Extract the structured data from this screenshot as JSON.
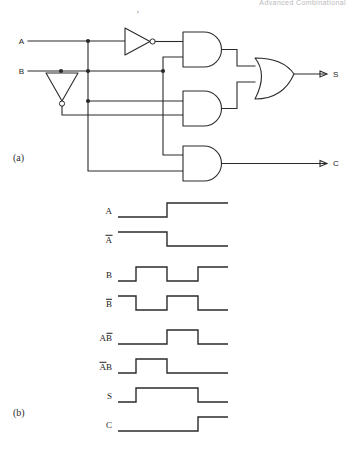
{
  "page": {
    "header_text": "Advanced Combinational",
    "figure_labels": {
      "a": "(a)",
      "b": "(b)"
    },
    "artifact_mark": "’"
  },
  "circuit": {
    "title_implied": "Half adder logic circuit",
    "inputs": [
      {
        "name": "A",
        "label": "A",
        "x": 22,
        "y": 41
      },
      {
        "name": "B",
        "label": "B",
        "x": 22,
        "y": 71
      }
    ],
    "outputs": [
      {
        "name": "S",
        "label": "S",
        "x": 335,
        "y": 73
      },
      {
        "name": "C",
        "label": "C",
        "x": 335,
        "y": 160
      }
    ],
    "gates": [
      {
        "name": "inverter-a",
        "type": "NOT",
        "orientation": "right",
        "output_signal": "A-bar"
      },
      {
        "name": "inverter-b",
        "type": "NOT",
        "orientation": "down",
        "output_signal": "B-bar"
      },
      {
        "name": "and-gate-top",
        "type": "AND",
        "inputs": [
          "A-bar",
          "B"
        ],
        "output_signal": "A-bar B"
      },
      {
        "name": "and-gate-middle",
        "type": "AND",
        "inputs": [
          "A",
          "B-bar"
        ],
        "output_signal": "A B-bar"
      },
      {
        "name": "and-gate-bottom",
        "type": "AND",
        "inputs": [
          "A",
          "B"
        ],
        "output_signal": "C"
      },
      {
        "name": "or-gate",
        "type": "OR",
        "inputs": [
          "A-bar B",
          "A B-bar"
        ],
        "output_signal": "S"
      }
    ]
  },
  "timing": {
    "caption_label": "(b)",
    "time_start": 118,
    "time_end": 228,
    "rows": [
      {
        "name": "A",
        "label_main": "A",
        "overline": "",
        "label_y": 211,
        "baseline_y": 217,
        "high_y": 203,
        "segments": [
          {
            "t": 118,
            "level": 0
          },
          {
            "t": 167,
            "level": 1
          },
          {
            "t": 228,
            "level": 1
          }
        ]
      },
      {
        "name": "A-bar",
        "label_main": "",
        "overline": "A",
        "label_y": 240,
        "baseline_y": 246,
        "high_y": 232,
        "segments": [
          {
            "t": 118,
            "level": 1
          },
          {
            "t": 167,
            "level": 0
          },
          {
            "t": 228,
            "level": 0
          }
        ]
      },
      {
        "name": "B",
        "label_main": "B",
        "overline": "",
        "label_y": 275,
        "baseline_y": 281,
        "high_y": 267,
        "segments": [
          {
            "t": 118,
            "level": 0
          },
          {
            "t": 136,
            "level": 1
          },
          {
            "t": 167,
            "level": 0
          },
          {
            "t": 198,
            "level": 1
          },
          {
            "t": 228,
            "level": 1
          }
        ]
      },
      {
        "name": "B-bar",
        "label_main": "",
        "overline": "B",
        "label_y": 304,
        "baseline_y": 310,
        "high_y": 296,
        "segments": [
          {
            "t": 118,
            "level": 1
          },
          {
            "t": 136,
            "level": 0
          },
          {
            "t": 167,
            "level": 1
          },
          {
            "t": 198,
            "level": 0
          },
          {
            "t": 228,
            "level": 0
          }
        ]
      },
      {
        "name": "A-Bbar",
        "label_main": "A",
        "overline": "B",
        "label_y": 338,
        "baseline_y": 344,
        "high_y": 330,
        "segments": [
          {
            "t": 118,
            "level": 0
          },
          {
            "t": 167,
            "level": 1
          },
          {
            "t": 198,
            "level": 0
          },
          {
            "t": 228,
            "level": 0
          }
        ]
      },
      {
        "name": "Abar-B",
        "label_main": "B",
        "overline": "A",
        "overline_first": true,
        "label_y": 367,
        "baseline_y": 373,
        "high_y": 359,
        "segments": [
          {
            "t": 118,
            "level": 0
          },
          {
            "t": 136,
            "level": 1
          },
          {
            "t": 167,
            "level": 0
          },
          {
            "t": 228,
            "level": 0
          }
        ]
      },
      {
        "name": "S",
        "label_main": "S",
        "overline": "",
        "label_y": 396,
        "baseline_y": 402,
        "high_y": 388,
        "segments": [
          {
            "t": 118,
            "level": 0
          },
          {
            "t": 136,
            "level": 1
          },
          {
            "t": 198,
            "level": 0
          },
          {
            "t": 228,
            "level": 0
          }
        ]
      },
      {
        "name": "C",
        "label_main": "C",
        "overline": "",
        "label_y": 425,
        "baseline_y": 431,
        "high_y": 417,
        "segments": [
          {
            "t": 118,
            "level": 0
          },
          {
            "t": 198,
            "level": 1
          },
          {
            "t": 228,
            "level": 1
          }
        ]
      }
    ]
  },
  "colors": {
    "ink": "#2b2b2b",
    "paper": "#ffffff",
    "header": "#b9b9bd"
  }
}
